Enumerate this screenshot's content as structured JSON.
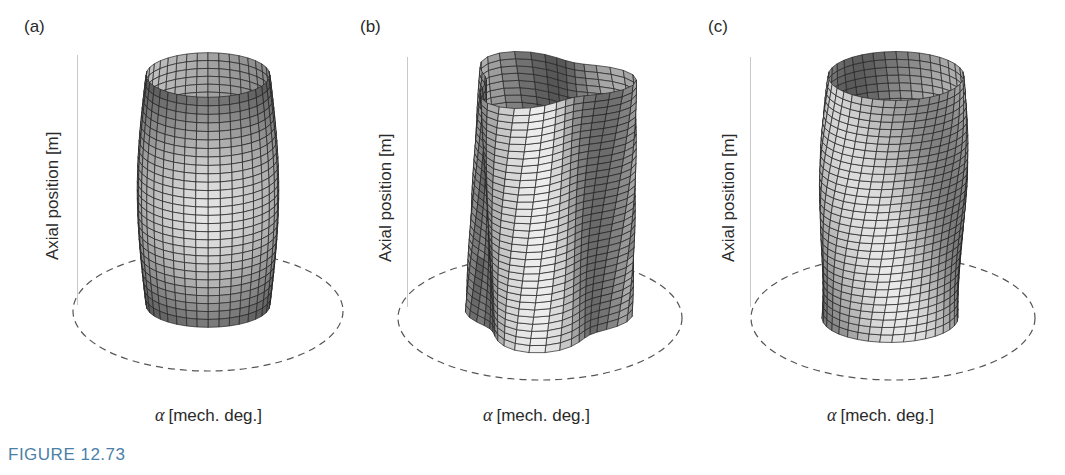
{
  "figure": {
    "caption": "FIGURE 12.73",
    "caption_color": "#4a7fa8",
    "panels": [
      {
        "id": "a",
        "label": "(a)",
        "ylabel": "Axial position [m]",
        "xlabel_symbol": "α",
        "xlabel": "[mech. deg.]",
        "shape": "barrel (bulging cylinder)"
      },
      {
        "id": "b",
        "label": "(b)",
        "ylabel": "Axial position [m]",
        "xlabel_symbol": "α",
        "xlabel": "[mech. deg.]",
        "shape": "lobed / twisted cylinder"
      },
      {
        "id": "c",
        "label": "(c)",
        "ylabel": "Axial position [m]",
        "xlabel_symbol": "α",
        "xlabel": "[mech. deg.]",
        "shape": "twisted wavy cylinder"
      }
    ]
  }
}
